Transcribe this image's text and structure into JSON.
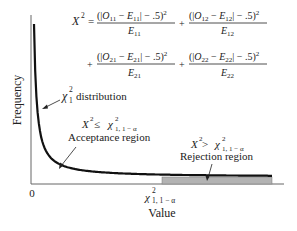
{
  "chart_data": {
    "type": "line",
    "title": "",
    "xlabel": "Value",
    "ylabel": "Frequency",
    "x_tick_labels": [
      "0",
      "χ²₁, 1 − α"
    ],
    "curve": {
      "name": "χ²₁ distribution",
      "description": "chi-square density with 1 degree of freedom",
      "df": 1
    },
    "critical_value_label": "χ²₁, 1 − α",
    "regions": [
      {
        "name": "Acceptance region",
        "condition": "X² ≤ χ²₁, 1 − α",
        "shaded": false
      },
      {
        "name": "Rejection region",
        "condition": "X² > χ²₁, 1 − α",
        "shaded": true,
        "fill": "#b3b3b3"
      }
    ],
    "grid": false,
    "legend": "none"
  },
  "formula": {
    "lhs": "X",
    "lhs_sup": "2",
    "equals": "=",
    "plus": "+",
    "terms": [
      {
        "num_O": "O",
        "num_O_sub": "11",
        "num_E": "E",
        "num_E_sub": "11",
        "den": "E",
        "den_sub": "11"
      },
      {
        "num_O": "O",
        "num_O_sub": "12",
        "num_E": "E",
        "num_E_sub": "12",
        "den": "E",
        "den_sub": "12"
      },
      {
        "num_O": "O",
        "num_O_sub": "21",
        "num_E": "E",
        "num_E_sub": "21",
        "den": "E",
        "den_sub": "21"
      },
      {
        "num_O": "O",
        "num_O_sub": "22",
        "num_E": "E",
        "num_E_sub": "22",
        "den": "E",
        "den_sub": "22"
      }
    ],
    "num_open": "(|",
    "num_minus": " − ",
    "num_close": "| − .5)",
    "num_sup": "2"
  },
  "labels": {
    "distribution_chi": "χ",
    "distribution_sup": "2",
    "distribution_sub": "1",
    "distribution_text": "distribution",
    "acceptance_cond_X": "X",
    "acceptance_cond_sup": "2",
    "acceptance_cond_op": " ≤ ",
    "rejection_cond_op": " > ",
    "chi": "χ",
    "chi_sup": "2",
    "chi_sub": "1, 1 − α",
    "acceptance_text": "Acceptance region",
    "rejection_text": "Rejection region",
    "zero": "0",
    "xlabel": "Value",
    "ylabel": "Frequency"
  },
  "colors": {
    "curve": "#111111",
    "axis": "#555555",
    "rejection_fill": "#b3b3b3"
  }
}
